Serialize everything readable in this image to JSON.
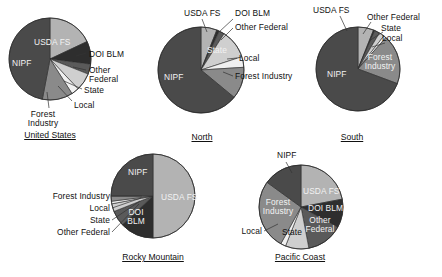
{
  "figure": {
    "background": "#ffffff",
    "series_names": [
      "USDA FS",
      "DOI BLM",
      "Other Federal",
      "State",
      "Local",
      "Forest Industry",
      "NIPF"
    ],
    "colors": {
      "usda_fs": "#b3b3b3",
      "doi_blm": "#2e2e2e",
      "other_federal": "#5a5a5a",
      "state": "#cfcfcf",
      "local": "#f0f0f0",
      "forest_industry": "#8a8a8a",
      "nipf": "#4a4a4a",
      "outline": "#2b2b2b",
      "leader": "#333333",
      "text": "#111111"
    }
  },
  "charts": [
    {
      "id": "united-states",
      "caption": "United States",
      "type": "pie",
      "categories": [
        "USDA FS",
        "DOI BLM",
        "Other Federal",
        "State",
        "Local",
        "Forest Industry",
        "NIPF"
      ],
      "values": [
        18,
        9,
        4,
        7,
        3,
        12,
        47
      ],
      "labels": [
        {
          "key": "usda_fs",
          "text": "USDA FS",
          "placement": "inside"
        },
        {
          "key": "doi_blm",
          "text": "DOI BLM",
          "placement": "outside"
        },
        {
          "key": "other_federal",
          "text": "Other\nFederal",
          "placement": "outside"
        },
        {
          "key": "state",
          "text": "State",
          "placement": "outside"
        },
        {
          "key": "local",
          "text": "Local",
          "placement": "outside"
        },
        {
          "key": "forest_industry",
          "text": "Forest\nIndustry",
          "placement": "outside"
        },
        {
          "key": "nipf",
          "text": "NIPF",
          "placement": "inside"
        }
      ]
    },
    {
      "id": "north",
      "caption": "North",
      "type": "pie",
      "categories": [
        "USDA FS",
        "DOI BLM",
        "Other Federal",
        "State",
        "Local",
        "Forest Industry",
        "NIPF"
      ],
      "values": [
        6,
        1,
        2,
        11,
        4,
        12,
        64
      ],
      "labels": [
        {
          "key": "usda_fs",
          "text": "USDA FS",
          "placement": "outside"
        },
        {
          "key": "doi_blm",
          "text": "DOI BLM",
          "placement": "outside"
        },
        {
          "key": "other_federal",
          "text": "Other Federal",
          "placement": "outside"
        },
        {
          "key": "state",
          "text": "State",
          "placement": "inside"
        },
        {
          "key": "local",
          "text": "Local",
          "placement": "outside"
        },
        {
          "key": "forest_industry",
          "text": "Forest Industry",
          "placement": "outside"
        },
        {
          "key": "nipf",
          "text": "NIPF",
          "placement": "inside"
        }
      ]
    },
    {
      "id": "south",
      "caption": "South",
      "type": "pie",
      "categories": [
        "USDA FS",
        "DOI BLM",
        "Other Federal",
        "State",
        "Local",
        "Forest Industry",
        "NIPF"
      ],
      "values": [
        6,
        0.5,
        2,
        2,
        1,
        19,
        69
      ],
      "labels": [
        {
          "key": "usda_fs",
          "text": "USDA FS",
          "placement": "outside"
        },
        {
          "key": "other_federal",
          "text": "Other Federal",
          "placement": "outside"
        },
        {
          "key": "state",
          "text": "State",
          "placement": "outside"
        },
        {
          "key": "local",
          "text": "Local",
          "placement": "outside"
        },
        {
          "key": "forest_industry",
          "text": "Forest\nIndustry",
          "placement": "inside"
        },
        {
          "key": "nipf",
          "text": "NIPF",
          "placement": "inside"
        }
      ]
    },
    {
      "id": "rocky-mountain",
      "caption": "Rocky Mountain",
      "type": "pie",
      "categories": [
        "USDA FS",
        "DOI BLM",
        "Other Federal",
        "State",
        "Local",
        "Forest Industry",
        "NIPF"
      ],
      "values": [
        50,
        13,
        6,
        3,
        1,
        2,
        25
      ],
      "labels": [
        {
          "key": "usda_fs",
          "text": "USDA FS",
          "placement": "inside"
        },
        {
          "key": "doi_blm",
          "text": "DOI\nBLM",
          "placement": "inside"
        },
        {
          "key": "other_federal",
          "text": "Other Federal",
          "placement": "outside"
        },
        {
          "key": "state",
          "text": "State",
          "placement": "outside"
        },
        {
          "key": "local",
          "text": "Local",
          "placement": "outside"
        },
        {
          "key": "forest_industry",
          "text": "Forest Industry",
          "placement": "outside"
        },
        {
          "key": "nipf",
          "text": "NIPF",
          "placement": "inside"
        }
      ]
    },
    {
      "id": "pacific-coast",
      "caption": "Pacific Coast",
      "type": "pie",
      "categories": [
        "USDA FS",
        "DOI BLM",
        "Other Federal",
        "State",
        "Local",
        "Forest Industry",
        "NIPF"
      ],
      "values": [
        22,
        11,
        14,
        9,
        2,
        27,
        15
      ],
      "labels": [
        {
          "key": "usda_fs",
          "text": "USDA FS",
          "placement": "inside"
        },
        {
          "key": "doi_blm",
          "text": "DOI BLM",
          "placement": "inside"
        },
        {
          "key": "other_federal",
          "text": "Other\nFederal",
          "placement": "inside"
        },
        {
          "key": "state",
          "text": "State",
          "placement": "inside"
        },
        {
          "key": "local",
          "text": "Local",
          "placement": "outside"
        },
        {
          "key": "forest_industry",
          "text": "Forest\nIndustry",
          "placement": "inside"
        },
        {
          "key": "nipf",
          "text": "NIPF",
          "placement": "outside"
        }
      ]
    }
  ],
  "chart_data": {
    "type": "pie",
    "title": "",
    "multiple": true,
    "categories": [
      "USDA FS",
      "DOI BLM",
      "Other Federal",
      "State",
      "Local",
      "Forest Industry",
      "NIPF"
    ],
    "units": "percent of timberland area",
    "charts": [
      {
        "name": "United States",
        "values": [
          18,
          9,
          4,
          7,
          3,
          12,
          47
        ]
      },
      {
        "name": "North",
        "values": [
          6,
          1,
          2,
          11,
          4,
          12,
          64
        ]
      },
      {
        "name": "South",
        "values": [
          6,
          0.5,
          2,
          2,
          1,
          19,
          69
        ]
      },
      {
        "name": "Rocky Mountain",
        "values": [
          50,
          13,
          6,
          3,
          1,
          2,
          25
        ]
      },
      {
        "name": "Pacific Coast",
        "values": [
          22,
          11,
          14,
          9,
          2,
          27,
          15
        ]
      }
    ],
    "legend": "none",
    "grid": false
  }
}
